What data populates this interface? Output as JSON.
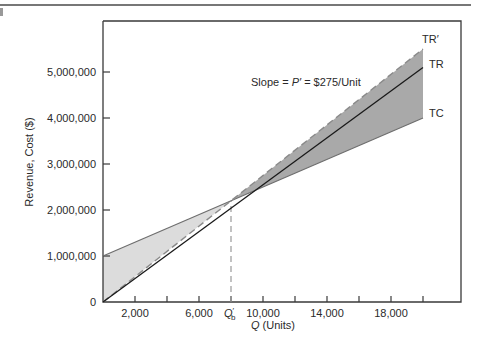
{
  "chart_data": {
    "type": "line",
    "title": "",
    "xlabel": "Q (Units)",
    "xlabel_italic_part": "Q",
    "xlabel_rest": " (Units)",
    "ylabel": "Revenue, Cost ($)",
    "xlim": [
      0,
      22300
    ],
    "ylim": [
      0,
      6100000
    ],
    "grid": false,
    "legend": "inline labels at line ends",
    "x_ticks": [
      2000,
      4000,
      6000,
      8000,
      10000,
      12000,
      14000,
      16000,
      18000,
      20000
    ],
    "x_tick_labels": [
      {
        "x": 2000,
        "label": "2,000"
      },
      {
        "x": 6000,
        "label": "6,000"
      },
      {
        "x": 10000,
        "label": "10,000"
      },
      {
        "x": 14000,
        "label": "14,000"
      },
      {
        "x": 18000,
        "label": "18,000"
      }
    ],
    "y_ticks": [
      0,
      1000000,
      2000000,
      3000000,
      4000000,
      5000000
    ],
    "y_tick_labels": [
      "0",
      "1,000,000",
      "2,000,000",
      "3,000,000",
      "4,000,000",
      "5,000,000"
    ],
    "series": [
      {
        "name": "TR′",
        "style": "dashed",
        "x": [
          0,
          20000
        ],
        "values": [
          0,
          5500000
        ]
      },
      {
        "name": "TR",
        "style": "solid",
        "x": [
          0,
          20000
        ],
        "values": [
          0,
          5100000
        ]
      },
      {
        "name": "TC",
        "style": "solid-gray",
        "x": [
          0,
          20000
        ],
        "values": [
          1000000,
          4000000
        ]
      }
    ],
    "shaded_regions": [
      {
        "name": "loss region",
        "between": [
          "TC",
          "TR′"
        ],
        "x_range": [
          0,
          8000
        ],
        "color": "#dcdcdc"
      },
      {
        "name": "profit region",
        "between": [
          "TC",
          "TR′"
        ],
        "x_range": [
          8000,
          20000
        ],
        "color": "#a9a9a9"
      }
    ],
    "annotations": [
      {
        "text": "Slope = P′ = $275/Unit",
        "x": 12800,
        "y": 4700000
      },
      {
        "text": "Q′b",
        "x": 8000,
        "y": 0,
        "type": "breakeven-marker",
        "line": "dashed vertical from axis to TC/TR′ intersection"
      }
    ],
    "breakeven_point": {
      "label_main": "Q",
      "label_sup": "′",
      "label_sub": "b",
      "x": 8000,
      "y": 2200000
    }
  },
  "labels": {
    "tr_prime": "TR′",
    "tr": "TR",
    "tc": "TC",
    "slope": "Slope = P′ = $275/Unit",
    "slope_prefix": "Slope = ",
    "slope_p": "P′",
    "slope_suffix": " = $275/Unit",
    "qb_main": "Q",
    "qb_sup": "′",
    "qb_sub": "b",
    "xlabel_q": "Q",
    "xlabel_rest": " (Units)",
    "ylabel": "Revenue, Cost ($)"
  },
  "colors": {
    "axis": "#3a3a3a",
    "tr_line": "#1a1a1a",
    "tr_prime_line": "#8a8a8a",
    "tc_line": "#6e6e6e",
    "loss_fill": "#dcdcdc",
    "profit_fill": "#a9a9a9",
    "dashed_marker": "#9a9a9a"
  }
}
